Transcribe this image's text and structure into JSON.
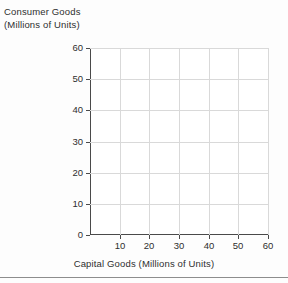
{
  "chart_data": {
    "type": "scatter",
    "title": "",
    "subtitle": "",
    "xlabel": "Capital Goods (Millions of Units)",
    "ylabel_lines": [
      "Consumer Goods",
      "(Millions of Units)"
    ],
    "ylabel": "Consumer Goods (Millions of Units)",
    "xlim": [
      0,
      60
    ],
    "ylim": [
      0,
      60
    ],
    "x_ticks": [
      10,
      20,
      30,
      40,
      50,
      60
    ],
    "y_ticks": [
      0,
      10,
      20,
      30,
      40,
      50,
      60
    ],
    "x_tick_labels": [
      "10",
      "20",
      "30",
      "40",
      "50",
      "60"
    ],
    "y_tick_labels": [
      "0",
      "10",
      "20",
      "30",
      "40",
      "50",
      "60"
    ],
    "grid": true,
    "grid_color": "#d9d9d9",
    "axis_color": "#4a4a4a",
    "background_color": "#ffffff",
    "legend": [],
    "legend_position": "none",
    "annotations": [],
    "series": [],
    "x": [],
    "values": [],
    "note": "empty plotting grid; no data series drawn"
  },
  "figure": {
    "y_axis_title_line1": "Consumer Goods",
    "y_axis_title_line2": "(Millions of Units)",
    "x_axis_title": "Capital Goods (Millions of Units)"
  }
}
